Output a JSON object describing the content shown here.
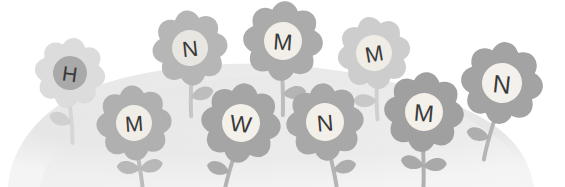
{
  "illustration": {
    "title": "Decorative grayscale flower meadow banner",
    "width": 565,
    "height": 187,
    "background_color": "#ffffff",
    "hill": {
      "name": "grassy-hill-mound",
      "fill_color": "#e8e8e8",
      "shadow_color": "#dedede",
      "apex_x": 265,
      "apex_y": 69
    },
    "palette": {
      "petal_very_light": "#e2e2e2",
      "petal_light": "#d2d2d2",
      "petal_mid": "#bdbdbd",
      "petal_dark": "#a6a6a6",
      "petal_darkest": "#9a9a9a",
      "center_white": "#f7f5f0",
      "center_gray": "#a8a8a8",
      "letter_color": "#3a3a3a",
      "stem_light": "#dcdcdc",
      "stem_dark": "#bfbfbf"
    },
    "flowers": [
      {
        "id": "flower-h",
        "letter": "H",
        "cx": 70,
        "cy": 73,
        "petal_radius": 31,
        "center_radius": 17,
        "petal_color": "#dcdcdc",
        "center_color": "#a9a9a9",
        "letter_color": "#3f3f3f",
        "letter_size": 21,
        "rotation": 8,
        "stem_length": 52,
        "stem_color": "#d6d6d6",
        "stem_bend": 12,
        "leaf_side": "left",
        "leaf_color": "#d0d0d0"
      },
      {
        "id": "flower-n-top-left",
        "letter": "N",
        "cx": 190,
        "cy": 48,
        "petal_radius": 33,
        "center_radius": 18,
        "petal_color": "#b6b6b6",
        "center_color": "#e8e6e1",
        "letter_color": "#4a4a4a",
        "letter_size": 22,
        "rotation": -6,
        "stem_length": 50,
        "stem_color": "#c6c6c6",
        "stem_bend": -6,
        "leaf_side": "right",
        "leaf_color": "#bdbdbd"
      },
      {
        "id": "flower-m-top-center",
        "letter": "M",
        "cx": 283,
        "cy": 41,
        "petal_radius": 35,
        "center_radius": 19,
        "petal_color": "#ababab",
        "center_color": "#f2efe9",
        "letter_color": "#343434",
        "letter_size": 23,
        "rotation": 4,
        "stem_length": 55,
        "stem_color": "#bcbcbc",
        "stem_bend": 5,
        "leaf_side": "right",
        "leaf_color": "#b4b4b4"
      },
      {
        "id": "flower-m-top-right",
        "letter": "M",
        "cx": 374,
        "cy": 53,
        "petal_radius": 32,
        "center_radius": 18,
        "petal_color": "#cdcdcd",
        "center_color": "#f0ede7",
        "letter_color": "#4c4c4c",
        "letter_size": 22,
        "rotation": -10,
        "stem_length": 48,
        "stem_color": "#d0d0d0",
        "stem_bend": -8,
        "leaf_side": "left",
        "leaf_color": "#c8c8c8"
      },
      {
        "id": "flower-n-far-right",
        "letter": "N",
        "cx": 502,
        "cy": 83,
        "petal_radius": 36,
        "center_radius": 20,
        "petal_color": "#a3a3a3",
        "center_color": "#f4f1ec",
        "letter_color": "#2f2f2f",
        "letter_size": 25,
        "rotation": 6,
        "stem_length": 58,
        "stem_color": "#b5b5b5",
        "stem_bend": -10,
        "leaf_side": "left",
        "leaf_color": "#aeaeae"
      },
      {
        "id": "flower-m-bottom-left",
        "letter": "M",
        "cx": 134,
        "cy": 123,
        "petal_radius": 33,
        "center_radius": 18,
        "petal_color": "#b0b0b0",
        "center_color": "#f1eee8",
        "letter_color": "#3b3b3b",
        "letter_size": 22,
        "rotation": -4,
        "stem_length": 46,
        "stem_color": "#bdbdbd",
        "stem_bend": 4,
        "leaf_side": "both",
        "leaf_color": "#b8b8b8"
      },
      {
        "id": "flower-w-bottom",
        "letter": "W",
        "cx": 241,
        "cy": 123,
        "petal_radius": 35,
        "center_radius": 19,
        "petal_color": "#a5a5a5",
        "center_color": "#f4f1eb",
        "letter_color": "#323232",
        "letter_size": 23,
        "rotation": 7,
        "stem_length": 50,
        "stem_color": "#b2b2b2",
        "stem_bend": -8,
        "leaf_side": "left",
        "leaf_color": "#ababab"
      },
      {
        "id": "flower-n-bottom",
        "letter": "N",
        "cx": 325,
        "cy": 122,
        "petal_radius": 34,
        "center_radius": 19,
        "petal_color": "#a8a8a8",
        "center_color": "#f3f0ea",
        "letter_color": "#343434",
        "letter_size": 23,
        "rotation": -5,
        "stem_length": 48,
        "stem_color": "#b4b4b4",
        "stem_bend": 6,
        "leaf_side": "right",
        "leaf_color": "#aeaeae"
      },
      {
        "id": "flower-m-bottom-right",
        "letter": "M",
        "cx": 424,
        "cy": 112,
        "petal_radius": 35,
        "center_radius": 19,
        "petal_color": "#a0a0a0",
        "center_color": "#f4f1eb",
        "letter_color": "#2e2e2e",
        "letter_size": 24,
        "rotation": 5,
        "stem_length": 56,
        "stem_color": "#b0b0b0",
        "stem_bend": 6,
        "leaf_side": "both",
        "leaf_color": "#a9a9a9"
      }
    ]
  }
}
